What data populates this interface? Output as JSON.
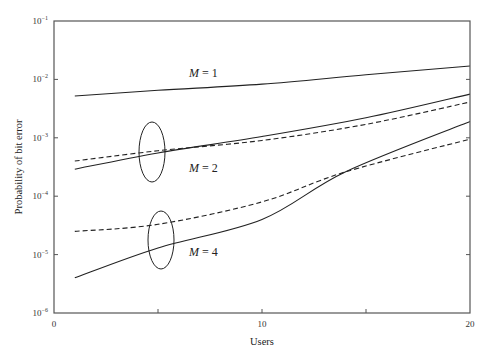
{
  "chart_data": {
    "type": "line",
    "title": "",
    "xlabel": "Users",
    "ylabel": "Probability of bit error",
    "xlim": [
      0,
      20
    ],
    "ylim": [
      1e-06,
      0.1
    ],
    "yscale": "log",
    "grid": false,
    "x_ticks": [
      0,
      5,
      10,
      15,
      20
    ],
    "x_tick_labels": [
      "0",
      "",
      "10",
      "",
      "20"
    ],
    "y_ticks": [
      -6,
      -5,
      -4,
      -3,
      -2,
      -1
    ],
    "y_tick_labels": [
      "10",
      "10",
      "10",
      "10",
      "10",
      "10"
    ],
    "y_tick_exponents": [
      "−6",
      "−5",
      "−4",
      "−3",
      "−2",
      "−1"
    ],
    "series": [
      {
        "name": "M = 1 (solid)",
        "style": "solid",
        "x": [
          1,
          5,
          10,
          15,
          20
        ],
        "values": [
          0.0052,
          0.0065,
          0.0083,
          0.012,
          0.017
        ]
      },
      {
        "name": "M = 2 (solid)",
        "style": "solid",
        "x": [
          1,
          5,
          10,
          15,
          20
        ],
        "values": [
          0.00029,
          0.00055,
          0.00105,
          0.0022,
          0.0056
        ]
      },
      {
        "name": "M = 2 (dashed)",
        "style": "dashed",
        "x": [
          1,
          5,
          10,
          15,
          20
        ],
        "values": [
          0.0004,
          0.0006,
          0.0009,
          0.0017,
          0.0041
        ]
      },
      {
        "name": "M = 4 (solid)",
        "style": "solid",
        "x": [
          1,
          5,
          10,
          14,
          20
        ],
        "values": [
          4e-06,
          1.3e-05,
          4e-05,
          0.00026,
          0.0019
        ]
      },
      {
        "name": "M = 4 (dashed)",
        "style": "dashed",
        "x": [
          1,
          5,
          10,
          14,
          20
        ],
        "values": [
          2.5e-05,
          3.3e-05,
          8e-05,
          0.00026,
          0.00095
        ]
      }
    ],
    "annotations": [
      {
        "text": "M = 1",
        "x": 6.5,
        "y": 0.013
      },
      {
        "text": "M = 2",
        "x": 6.5,
        "y": 0.00028
      },
      {
        "text": "M = 4",
        "x": 6.5,
        "y": 1e-05
      },
      {
        "shape": "ellipse",
        "x": 4.7,
        "y": 0.0006
      },
      {
        "shape": "ellipse",
        "x": 5.1,
        "y": 2.6e-05
      }
    ]
  }
}
